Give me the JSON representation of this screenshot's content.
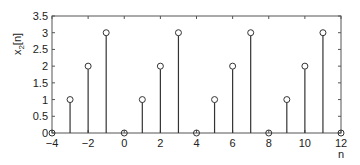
{
  "chart_data": {
    "type": "stem",
    "title": "",
    "xlabel": "n",
    "ylabel": "x2[n]",
    "ylabel_main": "x",
    "ylabel_sub": "2",
    "ylabel_suffix": "[n]",
    "xlim": [
      -4,
      12
    ],
    "ylim": [
      0,
      3.5
    ],
    "xticks": [
      -4,
      -2,
      0,
      2,
      4,
      6,
      8,
      10,
      12
    ],
    "yticks": [
      0,
      0.5,
      1,
      1.5,
      2,
      2.5,
      3,
      3.5
    ],
    "ytick_labels": [
      "0",
      "0.5",
      "1",
      "1.5",
      "2",
      "2.5",
      "3",
      "3.5"
    ],
    "grid": false,
    "x": [
      -4,
      -3,
      -2,
      -1,
      0,
      1,
      2,
      3,
      4,
      5,
      6,
      7,
      8,
      9,
      10,
      11,
      12
    ],
    "values": [
      0,
      1,
      2,
      3,
      0,
      1,
      2,
      3,
      0,
      1,
      2,
      3,
      0,
      1,
      2,
      3,
      0
    ],
    "marker": "circle-open",
    "color": "#333333"
  }
}
